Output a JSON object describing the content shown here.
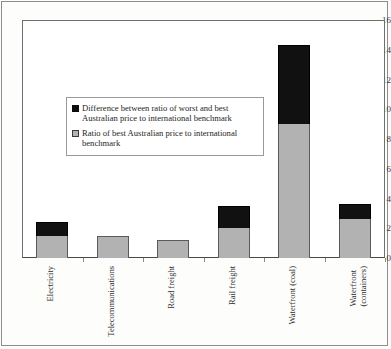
{
  "chart_data": {
    "type": "bar",
    "subtype": "stacked-bar",
    "title": "",
    "xlabel": "",
    "ylabel": "",
    "ylim": [
      0,
      16
    ],
    "ytick_step": 2,
    "yticks": [
      0,
      2,
      4,
      6,
      8,
      10,
      12,
      14,
      16
    ],
    "ytick_labels": [
      "0",
      "2",
      "4",
      "6",
      "8",
      "10",
      "12",
      "14",
      "16"
    ],
    "grid": false,
    "legend_position": "inside-upper-left",
    "categories": [
      "Electricity",
      "Telecommunications",
      "Road freight",
      "Rail freight",
      "Waterfront (coal)",
      "Waterfront\n(containers)"
    ],
    "series": [
      {
        "name": "Ratio of best Australian price to international benchmark",
        "color": "#b2b2b2",
        "values": [
          1.5,
          1.5,
          1.2,
          2.0,
          9.0,
          2.6
        ]
      },
      {
        "name": "Difference between ratio of worst and best Australian price to international benchmark",
        "color": "#111111",
        "values": [
          0.9,
          0.0,
          0.0,
          1.5,
          5.3,
          1.0
        ]
      }
    ],
    "totals": [
      2.4,
      1.5,
      1.2,
      3.5,
      14.3,
      3.6
    ]
  },
  "legend": {
    "items": [
      {
        "swatch": "dark",
        "label": "Difference between ratio of worst and best Australian price to international benchmark"
      },
      {
        "swatch": "light",
        "label": "Ratio of best Australian price to international benchmark"
      }
    ]
  }
}
